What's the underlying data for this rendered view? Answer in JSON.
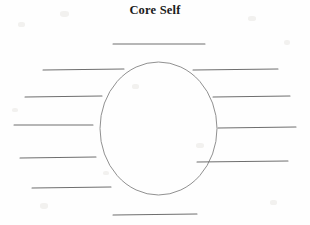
{
  "page": {
    "title": "Core Self",
    "background_color": "#fefefe",
    "width": 310,
    "height": 225
  },
  "diagram": {
    "type": "labeling-worksheet",
    "center_shape": {
      "name": "core-self-oval",
      "shape": "ellipse",
      "label": "",
      "cx": 158.5,
      "cy": 128.5,
      "rx": 58.5,
      "ry": 66.5,
      "stroke_color": "#8a8a8a"
    },
    "blank_lines": [
      {
        "id": "blank-top",
        "position": "top",
        "value": "",
        "x1": 113,
        "y1": 44,
        "x2": 205,
        "y2": 44
      },
      {
        "id": "blank-left-1",
        "position": "left",
        "value": "",
        "x1": 43,
        "y1": 70,
        "x2": 124,
        "y2": 69
      },
      {
        "id": "blank-left-2",
        "position": "left",
        "value": "",
        "x1": 25,
        "y1": 97,
        "x2": 102,
        "y2": 96
      },
      {
        "id": "blank-left-3",
        "position": "left",
        "value": "",
        "x1": 14,
        "y1": 125,
        "x2": 93,
        "y2": 125
      },
      {
        "id": "blank-left-4",
        "position": "left",
        "value": "",
        "x1": 20,
        "y1": 158,
        "x2": 96,
        "y2": 157
      },
      {
        "id": "blank-left-5",
        "position": "left",
        "value": "",
        "x1": 32,
        "y1": 188,
        "x2": 111,
        "y2": 187
      },
      {
        "id": "blank-right-1",
        "position": "right",
        "value": "",
        "x1": 193,
        "y1": 70,
        "x2": 278,
        "y2": 69
      },
      {
        "id": "blank-right-2",
        "position": "right",
        "value": "",
        "x1": 213,
        "y1": 97,
        "x2": 290,
        "y2": 96
      },
      {
        "id": "blank-right-3",
        "position": "right",
        "value": "",
        "x1": 218,
        "y1": 128,
        "x2": 296,
        "y2": 127
      },
      {
        "id": "blank-right-4",
        "position": "right",
        "value": "",
        "x1": 197,
        "y1": 162,
        "x2": 288,
        "y2": 161
      },
      {
        "id": "blank-bottom",
        "position": "bottom",
        "value": "",
        "x1": 113,
        "y1": 215,
        "x2": 197,
        "y2": 214
      }
    ],
    "counts": {
      "total_blanks": 11,
      "left_blanks": 5,
      "right_blanks": 4,
      "top_blanks": 1,
      "bottom_blanks": 1
    }
  }
}
